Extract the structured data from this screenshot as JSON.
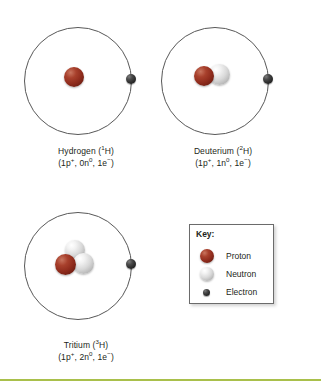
{
  "figure": {
    "kind": "isotopes-of-hydrogen-diagram",
    "background_color": "#ffffff",
    "rule_color": "#a9c04b"
  },
  "atoms": [
    {
      "id": "hydrogen",
      "name_line": "Hydrogen (1H)",
      "name_prefix": "Hydrogen (",
      "mass_number": "1",
      "element_symbol": "H)",
      "composition_parts": {
        "open": "(1p",
        "proton_charge": "+",
        "sep1": ", 0n",
        "neutron_charge": "0",
        "sep2": ", 1e",
        "electron_charge": "−",
        "close": ")"
      },
      "protons": 1,
      "neutrons": 0,
      "electrons": 1,
      "nucleus": [
        {
          "type": "proton",
          "x": 48,
          "y": 45,
          "size": 20
        }
      ],
      "electron_pos": {
        "x": 110,
        "y": 52,
        "size": 10
      }
    },
    {
      "id": "deuterium",
      "name_line": "Deuterium (2H)",
      "name_prefix": "Deuterium (",
      "mass_number": "2",
      "element_symbol": "H)",
      "composition_parts": {
        "open": "(1p",
        "proton_charge": "+",
        "sep1": ", 1n",
        "neutron_charge": "0",
        "sep2": ", 1e",
        "electron_charge": "−",
        "close": ")"
      },
      "protons": 1,
      "neutrons": 1,
      "electrons": 1,
      "nucleus": [
        {
          "type": "neutron",
          "x": 56,
          "y": 42,
          "size": 21
        },
        {
          "type": "proton",
          "x": 41,
          "y": 44,
          "size": 20
        }
      ],
      "electron_pos": {
        "x": 110,
        "y": 52,
        "size": 10
      }
    },
    {
      "id": "tritium",
      "name_line": "Tritium (3H)",
      "name_prefix": "Tritium (",
      "mass_number": "3",
      "element_symbol": "H)",
      "composition_parts": {
        "open": "(1p",
        "proton_charge": "+",
        "sep1": ", 2n",
        "neutron_charge": "0",
        "sep2": ", 1e",
        "electron_charge": "−",
        "close": ")"
      },
      "protons": 1,
      "neutrons": 2,
      "electrons": 1,
      "nucleus": [
        {
          "type": "neutron",
          "x": 49,
          "y": 33,
          "size": 20
        },
        {
          "type": "neutron",
          "x": 57,
          "y": 46,
          "size": 21
        },
        {
          "type": "proton",
          "x": 39,
          "y": 47,
          "size": 21
        }
      ],
      "electron_pos": {
        "x": 110,
        "y": 52,
        "size": 10
      }
    }
  ],
  "key": {
    "title": "Key:",
    "items": [
      {
        "label": "Proton",
        "swatch": "proton-sphere",
        "size": 14
      },
      {
        "label": "Neutron",
        "swatch": "neutron-sphere",
        "size": 14
      },
      {
        "label": "Electron",
        "swatch": "electron-sphere",
        "size": 7
      }
    ]
  }
}
